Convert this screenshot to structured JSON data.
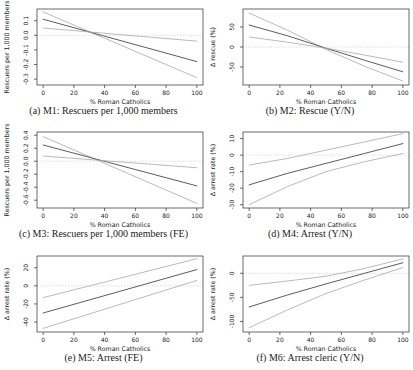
{
  "figure": {
    "background": "#ffffff",
    "colors": {
      "estimate_line": "#4a4a4a",
      "ci_line": "#a8a8a8",
      "zero_line": "#cccccc",
      "box_border": "#2b2b2b",
      "tick": "#2b2b2b",
      "text": "#222222"
    }
  },
  "x_axis": {
    "label": "% Roman Catholics",
    "range": [
      -4,
      104
    ],
    "ticks": [
      {
        "v": 0,
        "label": "0"
      },
      {
        "v": 20,
        "label": "20"
      },
      {
        "v": 40,
        "label": "40"
      },
      {
        "v": 60,
        "label": "60"
      },
      {
        "v": 80,
        "label": "80"
      },
      {
        "v": 100,
        "label": "100"
      }
    ]
  },
  "chart_data": [
    {
      "type": "line",
      "panel": "a",
      "caption": "(a) M1: Rescuers per 1,000 members",
      "ylabel": "Rescuers per 1,000 members",
      "xlabel": "% Roman Catholics",
      "ylim": [
        -0.34,
        0.18
      ],
      "zero_line": 0,
      "yticks": [
        {
          "v": -0.3,
          "label": "-0.3"
        },
        {
          "v": -0.2,
          "label": "-0.2"
        },
        {
          "v": -0.1,
          "label": "-0.1"
        },
        {
          "v": 0,
          "label": "0.0"
        },
        {
          "v": 0.1,
          "label": "0.1"
        }
      ],
      "series": [
        {
          "name": "ci_steep",
          "role": "ci",
          "points": [
            [
              0,
              0.16
            ],
            [
              100,
              -0.29
            ]
          ]
        },
        {
          "name": "estimate",
          "role": "estimate",
          "points": [
            [
              0,
              0.11
            ],
            [
              100,
              -0.18
            ]
          ]
        },
        {
          "name": "ci_shallow",
          "role": "ci",
          "points": [
            [
              0,
              0.05
            ],
            [
              100,
              -0.04
            ]
          ]
        }
      ]
    },
    {
      "type": "line",
      "panel": "b",
      "caption": "(b) M2: Rescue (Y/N)",
      "ylabel": "Δ rescue (%)",
      "xlabel": "% Roman Catholics",
      "ylim": [
        -95,
        95
      ],
      "zero_line": 0,
      "yticks": [
        {
          "v": -50,
          "label": "-50"
        },
        {
          "v": 0,
          "label": "0"
        },
        {
          "v": 50,
          "label": "50"
        }
      ],
      "series": [
        {
          "name": "ci_steep",
          "role": "ci",
          "points": [
            [
              0,
              85
            ],
            [
              25,
              42
            ],
            [
              50,
              -6
            ],
            [
              75,
              -48
            ],
            [
              100,
              -85
            ]
          ]
        },
        {
          "name": "estimate",
          "role": "estimate",
          "points": [
            [
              0,
              55
            ],
            [
              25,
              28
            ],
            [
              50,
              -3
            ],
            [
              75,
              -33
            ],
            [
              100,
              -62
            ]
          ]
        },
        {
          "name": "ci_shallow",
          "role": "ci",
          "points": [
            [
              0,
              25
            ],
            [
              25,
              12
            ],
            [
              50,
              -3
            ],
            [
              75,
              -20
            ],
            [
              100,
              -38
            ]
          ]
        }
      ]
    },
    {
      "type": "line",
      "panel": "c",
      "caption": "(c) M3: Rescuers per 1,000 members (FE)",
      "ylabel": "Rescuers per 1,000 members",
      "xlabel": "% Roman Catholics",
      "ylim": [
        -0.72,
        0.45
      ],
      "zero_line": 0,
      "yticks": [
        {
          "v": -0.6,
          "label": "-0.6"
        },
        {
          "v": -0.4,
          "label": "-0.4"
        },
        {
          "v": -0.2,
          "label": "-0.2"
        },
        {
          "v": 0,
          "label": "0.0"
        },
        {
          "v": 0.2,
          "label": "0.2"
        },
        {
          "v": 0.4,
          "label": "0.4"
        }
      ],
      "series": [
        {
          "name": "ci_steep",
          "role": "ci",
          "points": [
            [
              0,
              0.38
            ],
            [
              100,
              -0.65
            ]
          ]
        },
        {
          "name": "estimate",
          "role": "estimate",
          "points": [
            [
              0,
              0.25
            ],
            [
              100,
              -0.38
            ]
          ]
        },
        {
          "name": "ci_shallow",
          "role": "ci",
          "points": [
            [
              0,
              0.08
            ],
            [
              100,
              -0.1
            ]
          ]
        }
      ]
    },
    {
      "type": "line",
      "panel": "d",
      "caption": "(d) M4: Arrest (Y/N)",
      "ylabel": "Δ arrest rate (%)",
      "xlabel": "% Roman Catholics",
      "ylim": [
        -32,
        14
      ],
      "zero_line": 0,
      "yticks": [
        {
          "v": -30,
          "label": "-30"
        },
        {
          "v": -20,
          "label": "-20"
        },
        {
          "v": -10,
          "label": "-10"
        },
        {
          "v": 0,
          "label": "0"
        },
        {
          "v": 10,
          "label": "10"
        }
      ],
      "series": [
        {
          "name": "upper_ci",
          "role": "ci",
          "points": [
            [
              0,
              -6
            ],
            [
              25,
              -2
            ],
            [
              50,
              3
            ],
            [
              75,
              8
            ],
            [
              100,
              13
            ]
          ]
        },
        {
          "name": "estimate",
          "role": "estimate",
          "points": [
            [
              0,
              -18
            ],
            [
              25,
              -11
            ],
            [
              50,
              -5
            ],
            [
              75,
              1
            ],
            [
              100,
              7
            ]
          ]
        },
        {
          "name": "lower_ci",
          "role": "ci",
          "points": [
            [
              0,
              -30
            ],
            [
              25,
              -19
            ],
            [
              50,
              -10
            ],
            [
              75,
              -4
            ],
            [
              100,
              1
            ]
          ]
        }
      ]
    },
    {
      "type": "line",
      "panel": "e",
      "caption": "(e) M5: Arrest (FE)",
      "ylabel": "Δ arrest rate (%)",
      "xlabel": "% Roman Catholics",
      "ylim": [
        -51,
        33
      ],
      "zero_line": 0,
      "yticks": [
        {
          "v": -40,
          "label": "-40"
        },
        {
          "v": -20,
          "label": "-20"
        },
        {
          "v": 0,
          "label": "0"
        },
        {
          "v": 20,
          "label": "20"
        }
      ],
      "series": [
        {
          "name": "upper_ci",
          "role": "ci",
          "points": [
            [
              0,
              -13
            ],
            [
              100,
              30
            ]
          ]
        },
        {
          "name": "estimate",
          "role": "estimate",
          "points": [
            [
              0,
              -30
            ],
            [
              100,
              18
            ]
          ]
        },
        {
          "name": "lower_ci",
          "role": "ci",
          "points": [
            [
              0,
              -47
            ],
            [
              100,
              6
            ]
          ]
        }
      ]
    },
    {
      "type": "line",
      "panel": "f",
      "caption": "(f) M6: Arrest cleric (Y/N)",
      "ylabel": "Δ arrest rate (%)",
      "xlabel": "% Roman Catholics",
      "ylim": [
        -122,
        36
      ],
      "zero_line": 0,
      "yticks": [
        {
          "v": -100,
          "label": "-100"
        },
        {
          "v": -50,
          "label": "-50"
        },
        {
          "v": 0,
          "label": "0"
        }
      ],
      "series": [
        {
          "name": "upper_ci",
          "role": "ci",
          "points": [
            [
              0,
              -25
            ],
            [
              25,
              -16
            ],
            [
              50,
              -6
            ],
            [
              75,
              10
            ],
            [
              100,
              30
            ]
          ]
        },
        {
          "name": "estimate",
          "role": "estimate",
          "points": [
            [
              0,
              -70
            ],
            [
              25,
              -45
            ],
            [
              50,
              -22
            ],
            [
              75,
              0
            ],
            [
              100,
              22
            ]
          ]
        },
        {
          "name": "lower_ci",
          "role": "ci",
          "points": [
            [
              0,
              -113
            ],
            [
              25,
              -76
            ],
            [
              50,
              -42
            ],
            [
              75,
              -14
            ],
            [
              100,
              12
            ]
          ]
        }
      ]
    }
  ]
}
